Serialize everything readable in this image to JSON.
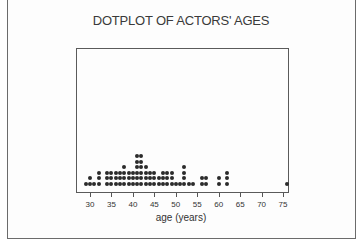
{
  "chart_data": {
    "type": "dotplot",
    "title": "DOTPLOT OF ACTORS' AGES",
    "xlabel": "age (years)",
    "ylabel": "",
    "xlim": [
      28,
      78
    ],
    "xticks": [
      30,
      35,
      40,
      45,
      50,
      55,
      60,
      65,
      70,
      75
    ],
    "tick_labels": [
      "30",
      "35",
      "40",
      "45",
      "50",
      "55",
      "60",
      "65",
      "70",
      "75"
    ],
    "grid": false,
    "legend": null,
    "counts": [
      {
        "age": 29,
        "count": 1
      },
      {
        "age": 30,
        "count": 2
      },
      {
        "age": 31,
        "count": 1
      },
      {
        "age": 32,
        "count": 3
      },
      {
        "age": 34,
        "count": 3
      },
      {
        "age": 35,
        "count": 3
      },
      {
        "age": 36,
        "count": 3
      },
      {
        "age": 37,
        "count": 3
      },
      {
        "age": 38,
        "count": 4
      },
      {
        "age": 39,
        "count": 3
      },
      {
        "age": 40,
        "count": 3
      },
      {
        "age": 41,
        "count": 6
      },
      {
        "age": 42,
        "count": 6
      },
      {
        "age": 43,
        "count": 4
      },
      {
        "age": 44,
        "count": 3
      },
      {
        "age": 45,
        "count": 3
      },
      {
        "age": 46,
        "count": 2
      },
      {
        "age": 47,
        "count": 3
      },
      {
        "age": 48,
        "count": 3
      },
      {
        "age": 49,
        "count": 3
      },
      {
        "age": 50,
        "count": 1
      },
      {
        "age": 51,
        "count": 1
      },
      {
        "age": 52,
        "count": 4
      },
      {
        "age": 53,
        "count": 1
      },
      {
        "age": 54,
        "count": 1
      },
      {
        "age": 56,
        "count": 2
      },
      {
        "age": 57,
        "count": 2
      },
      {
        "age": 60,
        "count": 2
      },
      {
        "age": 62,
        "count": 3
      },
      {
        "age": 76,
        "count": 1
      }
    ]
  },
  "layout": {
    "x0_age": 30,
    "x0_px": 90,
    "px_per_year": 4.29,
    "baseline_px": 182,
    "dot_step_px": 5.6
  }
}
